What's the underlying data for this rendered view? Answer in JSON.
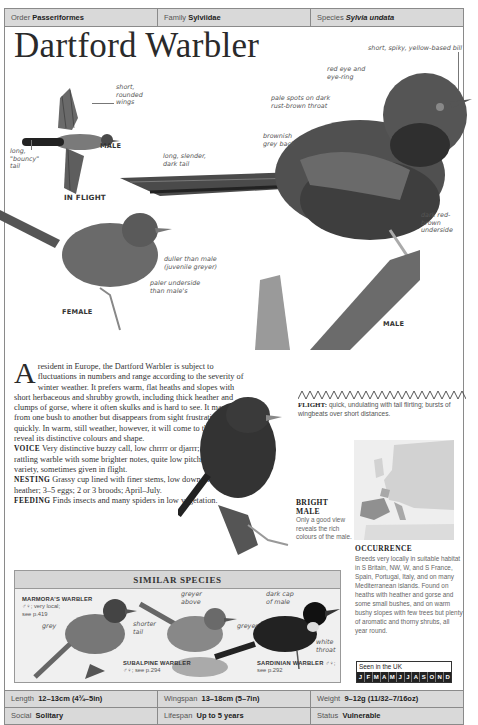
{
  "taxonomy": {
    "order_label": "Order",
    "order_value": "Passeriformes",
    "family_label": "Family",
    "family_value": "Sylviidae",
    "species_label": "Species",
    "species_value": "Sylvia undata"
  },
  "title": "Dartford Warbler",
  "in_flight": {
    "heading": "IN FLIGHT",
    "sex_label": "MALE",
    "annotations": {
      "wings": "short,\nrounded\nwings",
      "tail": "long,\n\"bouncy\"\ntail"
    }
  },
  "male": {
    "label": "MALE",
    "annotations": {
      "bill": "short, spiky, yellow-based bill",
      "eye": "red eye and\neye-ring",
      "throat": "pale spots on dark\nrust-brown throat",
      "back": "brownish\ngrey back",
      "tail": "long, slender,\ndark tail",
      "underside": "dark red-\nbrown\nunderside"
    }
  },
  "female": {
    "label": "FEMALE",
    "annotations": {
      "duller": "duller than male\n(juvenile greyer)",
      "underside": "paler underside\nthan male's"
    }
  },
  "description": {
    "drop_cap": "A",
    "intro": " resident in Europe, the Dartford Warbler is subject to fluctuations in numbers and range according to the severity of winter weather. It prefers warm, flat heaths and slopes with short herbaceous and shrubby growth, including thick heather and clumps of gorse, where it often skulks and is hard to see. It may flick from one bush to another but disappears from sight frustratingly quickly. In warm, still weather, however, it will come to the top and reveal its distinctive colours and shape.",
    "voice_head": "VOICE",
    "voice_text": " Very distinctive buzzy call, low chrrrr or djarrr; song quick, rattling warble with some brighter notes, quite low pitch, little variety, sometimes given in flight.",
    "nesting_head": "NESTING",
    "nesting_text": " Grassy cup lined with finer stems, low down in gorse or heather; 3–5 eggs; 2 or 3 broods; April–July.",
    "feeding_head": "FEEDING",
    "feeding_text": " Finds insects and many spiders in low vegetation."
  },
  "flight": {
    "label": "FLIGHT:",
    "text": " quick, undulating with tail flirting; bursts of wingbeats over short distances."
  },
  "bright_male": {
    "heading": "BRIGHT\nMALE",
    "text": "Only a good view reveals the rich colours of the male."
  },
  "occurrence": {
    "heading": "OCCURRENCE",
    "text": "Breeds very locally in suitable habitat in S Britain, NW, W, and S France, Spain, Portugal, Italy, and on many Mediterranean islands. Found on heaths with heather and gorse and some small bushes, and on warm bushy slopes with few trees but plenty of aromatic and thorny shrubs, all year round.",
    "seen_title": "Seen in the UK",
    "months": [
      "J",
      "F",
      "M",
      "A",
      "M",
      "J",
      "J",
      "A",
      "S",
      "O",
      "N",
      "D"
    ]
  },
  "similar_species": {
    "heading": "SIMILAR SPECIES",
    "marmora": {
      "name": "MARMORA'S WARBLER",
      "detail": "♂♀; very local;\nsee p.419",
      "note": "grey"
    },
    "subalpine": {
      "name": "SUBALPINE WARBLER",
      "detail": "♂♀; see p.294",
      "note_tail": "shorter\ntail",
      "note_above": "greyer\nabove"
    },
    "sardinian": {
      "name": "SARDINIAN WARBLER",
      "detail": "♂♀;\nsee p.292",
      "note_cap": "dark cap\nof male",
      "note_grey": "greyer",
      "note_throat": "white\nthroat"
    }
  },
  "stats": {
    "length_label": "Length",
    "length_value": "12–13cm (4¾–5in)",
    "wingspan_label": "Wingspan",
    "wingspan_value": "13–18cm (5–7in)",
    "weight_label": "Weight",
    "weight_value": "9–12g (11/32–7/16oz)",
    "social_label": "Social",
    "social_value": "Solitary",
    "lifespan_label": "Lifespan",
    "lifespan_value": "Up to 5 years",
    "status_label": "Status",
    "status_value": "Vulnerable"
  }
}
